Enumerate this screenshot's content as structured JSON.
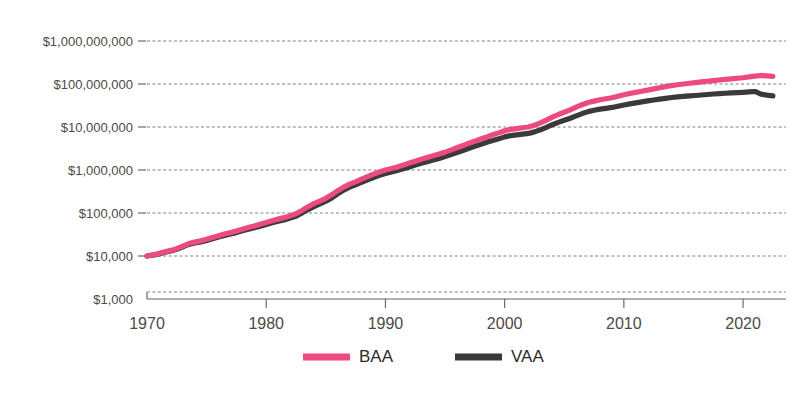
{
  "chart_data": {
    "type": "line",
    "title": "",
    "subtitle": "",
    "xlabel": "",
    "ylabel": "",
    "yscale": "log",
    "ylim": [
      1000,
      1000000000
    ],
    "xlim": [
      1970,
      2023
    ],
    "grid": true,
    "legend_position": "bottom",
    "y_ticks": [
      1000,
      10000,
      100000,
      1000000,
      10000000,
      100000000,
      1000000000
    ],
    "y_ticklabels": [
      "$1,000",
      "$10,000",
      "$100,000",
      "$1,000,000",
      "$10,000,000",
      "$100,000,000",
      "$1,000,000,000"
    ],
    "x_ticks": [
      1970,
      1980,
      1990,
      2000,
      2010,
      2020
    ],
    "x_ticklabels": [
      "1970",
      "1980",
      "1990",
      "2000",
      "2010",
      "2020"
    ],
    "series": [
      {
        "name": "BAA",
        "color": "#ec4a80",
        "x": [
          1970,
          1970.5,
          1971,
          1971.5,
          1972,
          1972.5,
          1973,
          1973.5,
          1974,
          1974.5,
          1975,
          1975.5,
          1976,
          1976.5,
          1977,
          1977.5,
          1978,
          1978.5,
          1979,
          1979.5,
          1980,
          1980.5,
          1981,
          1981.5,
          1982,
          1982.5,
          1983,
          1983.5,
          1984,
          1984.5,
          1985,
          1985.5,
          1986,
          1986.5,
          1987,
          1987.5,
          1988,
          1988.5,
          1989,
          1989.5,
          1990,
          1990.5,
          1991,
          1991.5,
          1992,
          1992.5,
          1993,
          1993.5,
          1994,
          1994.5,
          1995,
          1995.5,
          1996,
          1996.5,
          1997,
          1997.5,
          1998,
          1998.5,
          1999,
          1999.5,
          2000,
          2000.5,
          2001,
          2001.5,
          2002,
          2002.5,
          2003,
          2003.5,
          2004,
          2004.5,
          2005,
          2005.5,
          2006,
          2006.5,
          2007,
          2007.5,
          2008,
          2008.5,
          2009,
          2009.5,
          2010,
          2010.5,
          2011,
          2011.5,
          2012,
          2012.5,
          2013,
          2013.5,
          2014,
          2014.5,
          2015,
          2015.5,
          2016,
          2016.5,
          2017,
          2017.5,
          2018,
          2018.5,
          2019,
          2019.5,
          2020,
          2020.5,
          2021,
          2021.5,
          2022,
          2022.5
        ],
        "y": [
          10000,
          10600,
          11400,
          12500,
          13500,
          14800,
          17000,
          19500,
          21000,
          22500,
          24500,
          27000,
          29500,
          32500,
          35000,
          38000,
          42000,
          46000,
          50000,
          55000,
          60000,
          66000,
          72000,
          78000,
          86000,
          96000,
          115000,
          140000,
          165000,
          190000,
          220000,
          265000,
          330000,
          400000,
          470000,
          530000,
          610000,
          700000,
          800000,
          900000,
          1000000,
          1080000,
          1180000,
          1300000,
          1450000,
          1600000,
          1780000,
          1950000,
          2150000,
          2350000,
          2600000,
          2900000,
          3300000,
          3700000,
          4200000,
          4700000,
          5300000,
          5900000,
          6600000,
          7300000,
          8200000,
          8800000,
          9200000,
          9600000,
          10000000,
          11000000,
          12500000,
          14500000,
          17000000,
          19500000,
          22000000,
          25000000,
          29000000,
          33000000,
          37000000,
          40000000,
          43000000,
          45500000,
          48000000,
          52000000,
          56000000,
          60000000,
          64000000,
          68000000,
          72000000,
          77000000,
          82000000,
          87000000,
          92000000,
          96000000,
          100000000,
          104000000,
          108000000,
          112000000,
          116000000,
          120000000,
          124000000,
          128000000,
          132000000,
          136000000,
          140000000,
          146000000,
          152000000,
          158000000,
          155000000,
          150000000
        ]
      },
      {
        "name": "VAA",
        "color": "#3b3a38",
        "x": [
          1970,
          1970.5,
          1971,
          1971.5,
          1972,
          1972.5,
          1973,
          1973.5,
          1974,
          1974.5,
          1975,
          1975.5,
          1976,
          1976.5,
          1977,
          1977.5,
          1978,
          1978.5,
          1979,
          1979.5,
          1980,
          1980.5,
          1981,
          1981.5,
          1982,
          1982.5,
          1983,
          1983.5,
          1984,
          1984.5,
          1985,
          1985.5,
          1986,
          1986.5,
          1987,
          1987.5,
          1988,
          1988.5,
          1989,
          1989.5,
          1990,
          1990.5,
          1991,
          1991.5,
          1992,
          1992.5,
          1993,
          1993.5,
          1994,
          1994.5,
          1995,
          1995.5,
          1996,
          1996.5,
          1997,
          1997.5,
          1998,
          1998.5,
          1999,
          1999.5,
          2000,
          2000.5,
          2001,
          2001.5,
          2002,
          2002.5,
          2003,
          2003.5,
          2004,
          2004.5,
          2005,
          2005.5,
          2006,
          2006.5,
          2007,
          2007.5,
          2008,
          2008.5,
          2009,
          2009.5,
          2010,
          2010.5,
          2011,
          2011.5,
          2012,
          2012.5,
          2013,
          2013.5,
          2014,
          2014.5,
          2015,
          2015.5,
          2016,
          2016.5,
          2017,
          2017.5,
          2018,
          2018.5,
          2019,
          2019.5,
          2020,
          2020.5,
          2021,
          2021.5,
          2022,
          2022.5
        ],
        "y": [
          10000,
          10500,
          11200,
          12200,
          13100,
          14300,
          16300,
          18600,
          20000,
          21300,
          23000,
          25200,
          27500,
          30000,
          32500,
          35000,
          38500,
          42000,
          45500,
          49500,
          54000,
          59000,
          64000,
          69000,
          76000,
          84000,
          100000,
          120000,
          140000,
          162000,
          188000,
          225000,
          280000,
          340000,
          400000,
          450000,
          520000,
          590000,
          670000,
          750000,
          830000,
          900000,
          980000,
          1070000,
          1180000,
          1300000,
          1430000,
          1560000,
          1700000,
          1850000,
          2050000,
          2280000,
          2550000,
          2850000,
          3200000,
          3550000,
          3950000,
          4400000,
          4850000,
          5300000,
          5900000,
          6300000,
          6550000,
          6800000,
          7100000,
          7700000,
          8600000,
          9800000,
          11300000,
          12800000,
          14300000,
          16000000,
          18200000,
          20500000,
          22800000,
          24500000,
          26000000,
          27200000,
          28500000,
          30500000,
          32500000,
          34500000,
          36500000,
          38500000,
          40500000,
          42500000,
          44500000,
          46500000,
          48500000,
          50000000,
          51500000,
          52800000,
          54000000,
          55500000,
          57000000,
          58500000,
          60000000,
          61000000,
          62000000,
          63000000,
          64000000,
          65500000,
          67000000,
          58000000,
          55000000,
          53000000
        ]
      }
    ]
  },
  "legend": {
    "items": [
      {
        "label": "BAA",
        "color": "#ec4a80"
      },
      {
        "label": "VAA",
        "color": "#3b3a38"
      }
    ]
  }
}
